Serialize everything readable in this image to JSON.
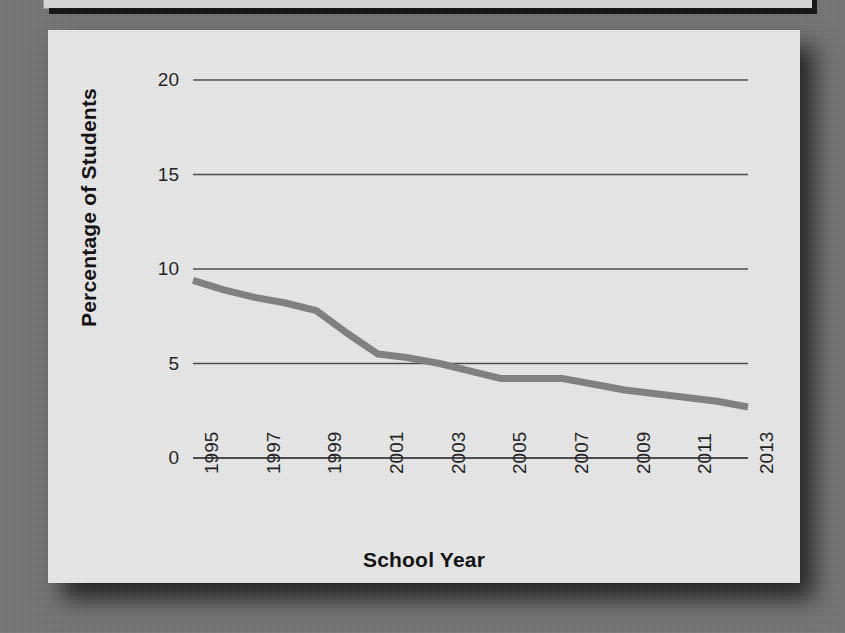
{
  "figure": {
    "background_color": "#747474",
    "card_color": "#e9e9e9",
    "line_color": "#808080",
    "axis_color": "#4a4a4a",
    "text_color": "#1c1c1c"
  },
  "axes": {
    "y_title": "Percentage of Students",
    "x_title": "School Year",
    "y_ticks": [
      "0",
      "5",
      "10",
      "15",
      "20"
    ],
    "x_ticks": [
      "1995",
      "1997",
      "1999",
      "2001",
      "2003",
      "2005",
      "2007",
      "2009",
      "2011",
      "2013"
    ]
  },
  "chart_data": {
    "type": "line",
    "title": "",
    "subtitle": "",
    "xlabel": "School Year",
    "ylabel": "Percentage of Students",
    "xlim": [
      1995,
      2013
    ],
    "ylim": [
      0,
      20
    ],
    "yticks": [
      0,
      5,
      10,
      15,
      20
    ],
    "xticks": [
      1995,
      1997,
      1999,
      2001,
      2003,
      2005,
      2007,
      2009,
      2011,
      2013
    ],
    "grid": "horizontal",
    "legend": "none",
    "x": [
      1995,
      1996,
      1997,
      1998,
      1999,
      2000,
      2001,
      2002,
      2003,
      2004,
      2005,
      2006,
      2007,
      2008,
      2009,
      2010,
      2011,
      2012,
      2013
    ],
    "series": [
      {
        "name": "Percentage of Students",
        "color": "#808080",
        "values": [
          9.4,
          8.9,
          8.5,
          8.2,
          7.8,
          6.6,
          5.5,
          5.3,
          5.0,
          4.6,
          4.2,
          4.2,
          4.2,
          3.9,
          3.6,
          3.4,
          3.2,
          3.0,
          2.7
        ]
      }
    ]
  }
}
